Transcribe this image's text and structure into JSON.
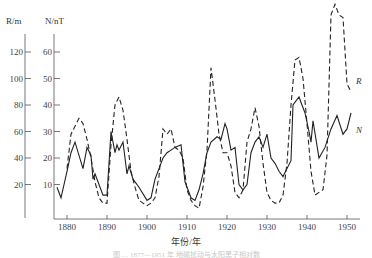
{
  "chart_data": {
    "type": "line",
    "title": "",
    "xlabel": "年份/年",
    "ylabel_left": "R/m",
    "ylabel_right": "N/nT",
    "x_ticks": [
      1880,
      1890,
      1900,
      1910,
      1920,
      1930,
      1940,
      1950
    ],
    "R_axis_ticks": [
      20,
      40,
      60,
      80,
      100,
      120
    ],
    "N_axis_ticks": [
      10,
      20,
      30,
      40,
      50,
      60
    ],
    "xlim": [
      1877,
      1952
    ],
    "ylim_N": [
      0,
      66
    ],
    "ylim_R": [
      0,
      132
    ],
    "grid": false,
    "legend": "inline labels at right end of each series",
    "series": [
      {
        "name": "N",
        "axis": "N/nT",
        "style": "solid",
        "x": [
          1877.5,
          1878.5,
          1880,
          1881,
          1882,
          1883,
          1884,
          1885,
          1886,
          1886.5,
          1887,
          1888,
          1889,
          1890,
          1891,
          1892,
          1892.5,
          1893,
          1894,
          1895,
          1895.5,
          1896.5,
          1898,
          1900,
          1901,
          1902,
          1903,
          1904,
          1905,
          1906,
          1907,
          1908.5,
          1909.5,
          1911,
          1912,
          1913,
          1914,
          1915,
          1916,
          1917.5,
          1918.5,
          1919.5,
          1920,
          1921,
          1922,
          1923,
          1924,
          1925,
          1926,
          1927,
          1928,
          1929,
          1930,
          1931,
          1932,
          1933,
          1934,
          1935,
          1936,
          1936.5,
          1938,
          1939.5,
          1940.5,
          1941,
          1941.5,
          1943,
          1944.5,
          1946,
          1947.5,
          1949,
          1950,
          1951
        ],
        "values": [
          9,
          5,
          15,
          22,
          26,
          21,
          16,
          24,
          21,
          12,
          14,
          10,
          6,
          6,
          30,
          22,
          25,
          23,
          26,
          14,
          17,
          12,
          9,
          4,
          5,
          12,
          16,
          20,
          22,
          23,
          24,
          25,
          11,
          5,
          4,
          8,
          14,
          22,
          26,
          28,
          27,
          33,
          31,
          23,
          24,
          10,
          8,
          10,
          22,
          26,
          28,
          24,
          29,
          20,
          18,
          15,
          13,
          16,
          19,
          40,
          43,
          37,
          30,
          26,
          34,
          20,
          24,
          31,
          36,
          29,
          31,
          37
        ]
      },
      {
        "name": "R",
        "axis": "R/m",
        "style": "dashed",
        "x": [
          1880,
          1881,
          1882,
          1883,
          1884,
          1885,
          1886,
          1887,
          1888,
          1889,
          1890,
          1891,
          1892,
          1893,
          1894,
          1895,
          1896,
          1897,
          1898,
          1899,
          1900,
          1901,
          1902,
          1903,
          1904,
          1905,
          1906,
          1907,
          1908,
          1909,
          1910,
          1911,
          1912,
          1913,
          1914,
          1915,
          1916,
          1917,
          1918,
          1919,
          1920,
          1921,
          1922,
          1923,
          1924,
          1925,
          1926,
          1927,
          1928,
          1929,
          1930,
          1931,
          1932,
          1933,
          1934,
          1935,
          1936,
          1937,
          1938,
          1939,
          1940,
          1941,
          1942,
          1943,
          1944,
          1945,
          1946,
          1947,
          1948,
          1949,
          1950,
          1951
        ],
        "values": [
          32,
          58,
          64,
          70,
          66,
          54,
          40,
          22,
          10,
          6,
          6,
          50,
          80,
          86,
          76,
          54,
          30,
          18,
          8,
          6,
          4,
          6,
          10,
          26,
          62,
          58,
          62,
          48,
          46,
          40,
          16,
          8,
          4,
          2,
          18,
          46,
          108,
          84,
          58,
          44,
          44,
          34,
          14,
          10,
          16,
          52,
          62,
          78,
          64,
          36,
          14,
          8,
          6,
          6,
          12,
          36,
          80,
          114,
          116,
          100,
          66,
          30,
          12,
          14,
          16,
          42,
          148,
          156,
          148,
          146,
          96,
          90
        ]
      }
    ],
    "series_labels": {
      "R": "R",
      "N": "N"
    },
    "caption": "图 … 1877—1951 年 地磁扰动与太阳黑子相对数"
  }
}
